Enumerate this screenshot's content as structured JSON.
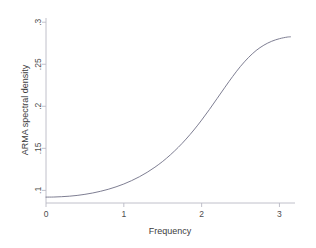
{
  "chart_data": {
    "type": "line",
    "title": "",
    "xlabel": "Frequency",
    "ylabel": "ARMA spectral density",
    "xlim": [
      0,
      3.2
    ],
    "ylim": [
      0.085,
      0.305
    ],
    "grid": false,
    "legend": null,
    "xticks": [
      0,
      1,
      2,
      3
    ],
    "xticklabels": [
      "0",
      "1",
      "2",
      "3"
    ],
    "yticks": [
      0.1,
      0.15,
      0.2,
      0.25,
      0.3
    ],
    "yticklabels": [
      ".1",
      ".15",
      ".2",
      ".25",
      ".3"
    ],
    "series": [
      {
        "name": "ARMA spectral density",
        "color": "#6f6f86",
        "x": [
          0.0,
          0.1,
          0.2,
          0.3,
          0.4,
          0.5,
          0.6,
          0.7,
          0.8,
          0.9,
          1.0,
          1.1,
          1.2,
          1.3,
          1.4,
          1.5,
          1.6,
          1.7,
          1.8,
          1.9,
          2.0,
          2.1,
          2.2,
          2.3,
          2.4,
          2.5,
          2.6,
          2.7,
          2.8,
          2.9,
          3.0,
          3.1,
          3.1416
        ],
        "y": [
          0.092,
          0.0921,
          0.0925,
          0.0931,
          0.094,
          0.0953,
          0.0969,
          0.0989,
          0.1013,
          0.1042,
          0.1076,
          0.1116,
          0.1162,
          0.1215,
          0.1276,
          0.1345,
          0.1424,
          0.1512,
          0.161,
          0.1718,
          0.1836,
          0.1962,
          0.2094,
          0.2227,
          0.2356,
          0.2475,
          0.2578,
          0.2663,
          0.2727,
          0.2773,
          0.2804,
          0.2823,
          0.2826
        ]
      }
    ]
  },
  "axes": {
    "x_tick_labels": [
      "0",
      "1",
      "2",
      "3"
    ],
    "y_tick_labels": [
      ".1",
      ".15",
      ".2",
      ".25",
      ".3"
    ],
    "x_title": "Frequency",
    "y_title": "ARMA spectral density"
  },
  "colors": {
    "series": "#6f6f86",
    "axis": "#b9b9c4",
    "text": "#4d4d4d",
    "plot_background": "#ffffff",
    "figure_background": "#f2f2f2"
  }
}
